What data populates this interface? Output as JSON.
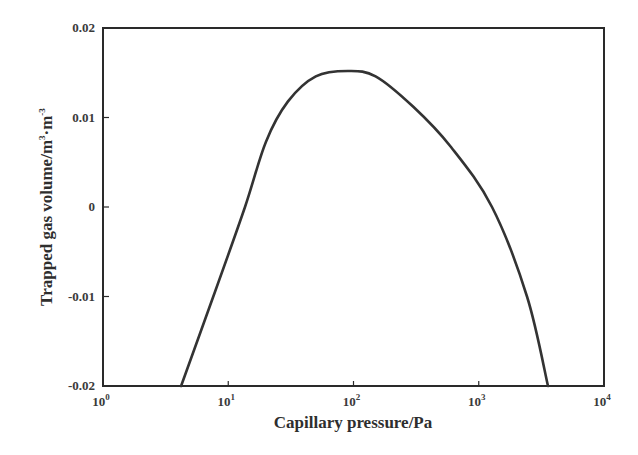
{
  "chart_data": {
    "type": "line",
    "title": "",
    "xlabel": "Capillary pressure/Pa",
    "ylabel_main": "Trapped gas volume/m",
    "ylabel_sup1": "3",
    "ylabel_mid": "·m",
    "ylabel_sup2": "-3",
    "ylabel": "Trapped gas volume/m^3·m^-3",
    "xscale": "log",
    "xlim": [
      1,
      10000
    ],
    "ylim": [
      -0.02,
      0.02
    ],
    "x_ticks": [
      {
        "base": "10",
        "exp": "0",
        "value": 1
      },
      {
        "base": "10",
        "exp": "1",
        "value": 10
      },
      {
        "base": "10",
        "exp": "2",
        "value": 100
      },
      {
        "base": "10",
        "exp": "3",
        "value": 1000
      },
      {
        "base": "10",
        "exp": "4",
        "value": 10000
      }
    ],
    "y_ticks": [
      {
        "label": "0.02",
        "value": 0.02
      },
      {
        "label": "0.01",
        "value": 0.01
      },
      {
        "label": "0",
        "value": 0
      },
      {
        "label": "-0.01",
        "value": -0.01
      },
      {
        "label": "-0.02",
        "value": -0.02
      }
    ],
    "grid": false,
    "legend": null,
    "series": [
      {
        "name": "Trapped gas volume",
        "color": "#333333",
        "x": [
          4.2,
          7.6,
          13.6,
          20,
          30,
          50,
          90,
          150,
          300,
          600,
          1276,
          2430,
          3570
        ],
        "y": [
          -0.02,
          -0.01,
          0.0,
          0.0073,
          0.0118,
          0.0146,
          0.0152,
          0.0146,
          0.0112,
          0.0067,
          0.0,
          -0.01,
          -0.02
        ]
      }
    ]
  }
}
